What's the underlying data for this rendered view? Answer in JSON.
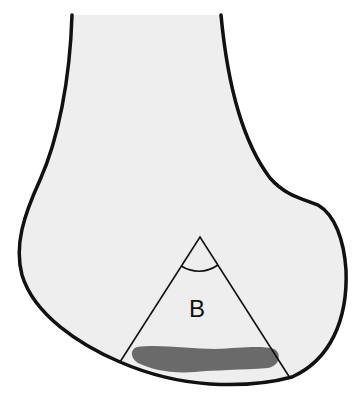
{
  "diagram": {
    "labels": {
      "region": "B"
    },
    "colors": {
      "background": "#ffffff",
      "bone_fill": "#eeeeee",
      "outline": "#111111",
      "lesion": "#6a6a6a"
    }
  }
}
